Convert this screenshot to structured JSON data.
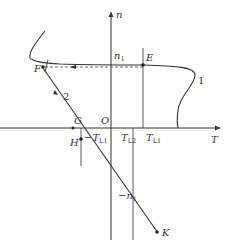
{
  "diagram": {
    "type": "mechanical-characteristic",
    "axes": {
      "x": {
        "label": "T"
      },
      "y": {
        "label": "n"
      },
      "origin": {
        "label": "O"
      }
    },
    "curves": [
      {
        "id": "1",
        "label": "1"
      },
      {
        "id": "2",
        "label": "2"
      }
    ],
    "points": [
      {
        "label": "E"
      },
      {
        "label": "F"
      },
      {
        "label": "G"
      },
      {
        "label": "H"
      },
      {
        "label": "K"
      }
    ],
    "tick_labels": {
      "n1": {
        "main": "n",
        "sub": "1"
      },
      "neg_n1": {
        "main": "−n",
        "sub": "1"
      },
      "T_L1": {
        "main": "T",
        "sub": "L1"
      },
      "T_L2": {
        "main": "T",
        "sub": "L2"
      },
      "neg_T_L1": {
        "main": "−T",
        "sub": "L1"
      }
    },
    "colors": {
      "line": "#333333",
      "dashed": "#555555",
      "background": "#ffffff"
    }
  }
}
